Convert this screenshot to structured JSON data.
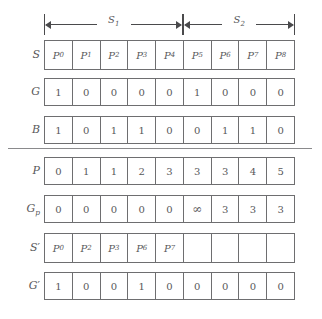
{
  "figure": {
    "spans": [
      {
        "label": "S",
        "sub": "1",
        "start_index": 0,
        "end_index": 4
      },
      {
        "label": "S",
        "sub": "2",
        "start_index": 5,
        "end_index": 8
      }
    ],
    "columns": 9,
    "rows": [
      {
        "label": "S",
        "label_sub": "",
        "label_prime": "",
        "kind": "symbolic",
        "cells": [
          {
            "text": "P",
            "sub": "0"
          },
          {
            "text": "P",
            "sub": "1"
          },
          {
            "text": "P",
            "sub": "2"
          },
          {
            "text": "P",
            "sub": "3"
          },
          {
            "text": "P",
            "sub": "4"
          },
          {
            "text": "P",
            "sub": "5"
          },
          {
            "text": "P",
            "sub": "6"
          },
          {
            "text": "P",
            "sub": "7"
          },
          {
            "text": "P",
            "sub": "8"
          }
        ]
      },
      {
        "label": "G",
        "label_sub": "",
        "label_prime": "",
        "kind": "numeric",
        "cells": [
          {
            "text": "1",
            "sub": ""
          },
          {
            "text": "0",
            "sub": ""
          },
          {
            "text": "0",
            "sub": ""
          },
          {
            "text": "0",
            "sub": ""
          },
          {
            "text": "0",
            "sub": ""
          },
          {
            "text": "1",
            "sub": ""
          },
          {
            "text": "0",
            "sub": ""
          },
          {
            "text": "0",
            "sub": ""
          },
          {
            "text": "0",
            "sub": ""
          }
        ]
      },
      {
        "label": "B",
        "label_sub": "",
        "label_prime": "",
        "kind": "numeric",
        "cells": [
          {
            "text": "1",
            "sub": ""
          },
          {
            "text": "0",
            "sub": ""
          },
          {
            "text": "1",
            "sub": ""
          },
          {
            "text": "1",
            "sub": ""
          },
          {
            "text": "0",
            "sub": ""
          },
          {
            "text": "0",
            "sub": ""
          },
          {
            "text": "1",
            "sub": ""
          },
          {
            "text": "1",
            "sub": ""
          },
          {
            "text": "0",
            "sub": ""
          }
        ]
      },
      {
        "label": "P",
        "label_sub": "",
        "label_prime": "",
        "kind": "numeric",
        "cells": [
          {
            "text": "0",
            "sub": ""
          },
          {
            "text": "1",
            "sub": ""
          },
          {
            "text": "1",
            "sub": ""
          },
          {
            "text": "2",
            "sub": ""
          },
          {
            "text": "3",
            "sub": ""
          },
          {
            "text": "3",
            "sub": ""
          },
          {
            "text": "3",
            "sub": ""
          },
          {
            "text": "4",
            "sub": ""
          },
          {
            "text": "5",
            "sub": ""
          }
        ]
      },
      {
        "label": "G",
        "label_sub": "p",
        "label_prime": "",
        "kind": "numeric",
        "cells": [
          {
            "text": "0",
            "sub": ""
          },
          {
            "text": "0",
            "sub": ""
          },
          {
            "text": "0",
            "sub": ""
          },
          {
            "text": "0",
            "sub": ""
          },
          {
            "text": "0",
            "sub": ""
          },
          {
            "text": "∞",
            "sub": ""
          },
          {
            "text": "3",
            "sub": ""
          },
          {
            "text": "3",
            "sub": ""
          },
          {
            "text": "3",
            "sub": ""
          }
        ]
      },
      {
        "label": "S",
        "label_sub": "",
        "label_prime": "′",
        "kind": "symbolic",
        "cells": [
          {
            "text": "P",
            "sub": "0"
          },
          {
            "text": "P",
            "sub": "2"
          },
          {
            "text": "P",
            "sub": "3"
          },
          {
            "text": "P",
            "sub": "6"
          },
          {
            "text": "P",
            "sub": "7"
          },
          {
            "text": "",
            "sub": ""
          },
          {
            "text": "",
            "sub": ""
          },
          {
            "text": "",
            "sub": ""
          },
          {
            "text": "",
            "sub": ""
          }
        ]
      },
      {
        "label": "G",
        "label_sub": "",
        "label_prime": "′",
        "kind": "numeric",
        "cells": [
          {
            "text": "1",
            "sub": ""
          },
          {
            "text": "0",
            "sub": ""
          },
          {
            "text": "0",
            "sub": ""
          },
          {
            "text": "1",
            "sub": ""
          },
          {
            "text": "0",
            "sub": ""
          },
          {
            "text": "0",
            "sub": ""
          },
          {
            "text": "0",
            "sub": ""
          },
          {
            "text": "0",
            "sub": ""
          },
          {
            "text": "0",
            "sub": ""
          }
        ]
      }
    ],
    "colors": {
      "stroke": "#6e6e70",
      "text": "#58585a",
      "divider": "#8a8a8c",
      "background": "#ffffff"
    }
  }
}
